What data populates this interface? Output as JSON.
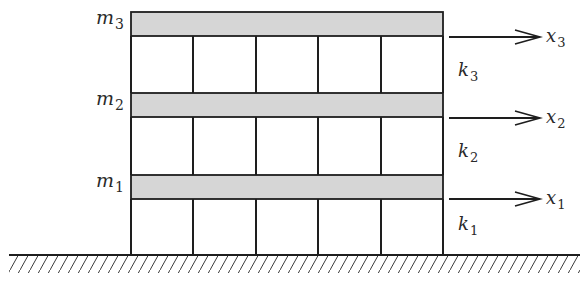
{
  "diagram": {
    "colors": {
      "line": "#1e1e1e",
      "slab_fill": "#d6d6d6",
      "background": "#ffffff",
      "text": "#2a2a2a"
    },
    "geometry": {
      "building_left": 131,
      "building_right": 443,
      "column_x": [
        131,
        193,
        256,
        318,
        381,
        443
      ],
      "ground_y": 255,
      "ground_x_start": 9,
      "ground_x_end": 580
    },
    "floors": [
      {
        "id": "floor-3",
        "mass_label": "m",
        "mass_sub": "3",
        "slab_top": 12,
        "slab_bottom": 36,
        "disp_label": "x",
        "disp_sub": "3",
        "arrow_y": 37,
        "stiffness_label": "k",
        "stiffness_sub": "3",
        "stiffness_y": 76
      },
      {
        "id": "floor-2",
        "mass_label": "m",
        "mass_sub": "2",
        "slab_top": 93,
        "slab_bottom": 117,
        "disp_label": "x",
        "disp_sub": "2",
        "arrow_y": 118,
        "stiffness_label": "k",
        "stiffness_sub": "2",
        "stiffness_y": 157
      },
      {
        "id": "floor-1",
        "mass_label": "m",
        "mass_sub": "1",
        "slab_top": 175,
        "slab_bottom": 199,
        "disp_label": "x",
        "disp_sub": "1",
        "arrow_y": 199,
        "stiffness_label": "k",
        "stiffness_sub": "1",
        "stiffness_y": 230
      }
    ]
  }
}
